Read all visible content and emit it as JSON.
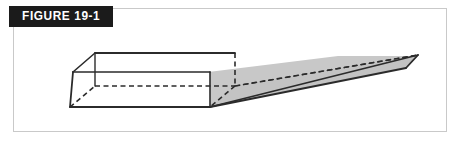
{
  "figure": {
    "banner_label": "FIGURE 19-1",
    "caption": "",
    "frame": {
      "border_color": "#c9c9c9",
      "background": "#ffffff"
    },
    "banner": {
      "background": "#1b1b1b",
      "text_color": "#ffffff"
    },
    "illustration": {
      "name": "wedge-solid-3d-diagram",
      "description": "Isometric line drawing of a long wedge (rectangular block at left tapering to a thin point at right), drawn with solid visible edges, dashed hidden edges, and a shaded gray base plane.",
      "stroke_color": "#2b2b2b",
      "hidden_stroke_color": "#2b2b2b",
      "fill_color": "#c8c8c8",
      "fill_color_dark": "#b5b5b5",
      "stroke_width": 1.6,
      "hidden_dash": "5,3.5"
    }
  }
}
